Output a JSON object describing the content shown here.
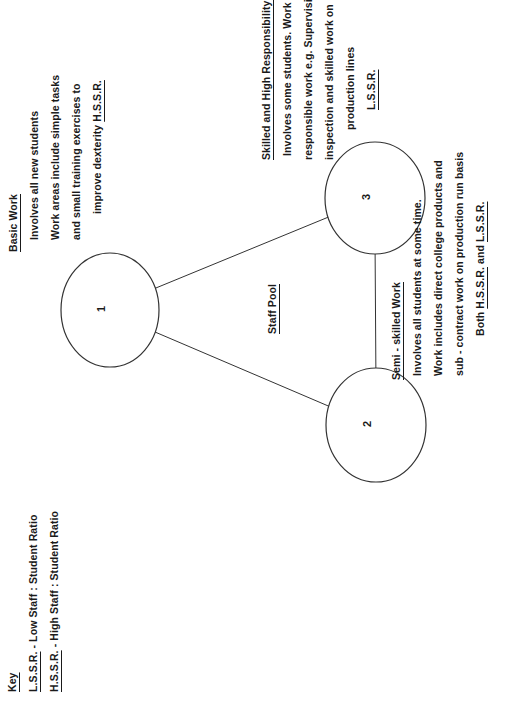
{
  "key": {
    "title": "Key",
    "items": [
      {
        "abbr": "L.S.S.R.",
        "text": " - Low Staff : Student Ratio"
      },
      {
        "abbr": "H.S.S.R.",
        "text": " - High Staff : Student Ratio"
      }
    ]
  },
  "nodes": [
    {
      "id": "1",
      "label": "1"
    },
    {
      "id": "2",
      "label": "2"
    },
    {
      "id": "3",
      "label": "3"
    }
  ],
  "center_label": "Staff Pool",
  "basic_work": {
    "title": "Basic Work",
    "lines": [
      "Involves all new students",
      "Work  areas include simple tasks",
      "and small training exercises to",
      "improve dexterity "
    ],
    "ratio": "H.S.S.R."
  },
  "skilled_work": {
    "title": "Skilled and High Responsibility Work",
    "lines": [
      "Involves some students. Work includes",
      "responsible work e.g. Supervision and",
      "inspection and skilled work on",
      "production lines"
    ],
    "ratio": "L.S.S.R."
  },
  "semi_skilled_work": {
    "title": "Semi - skilled Work",
    "lines": [
      "Involves all students at some time.",
      "Work includes direct college products and",
      "sub - contract work on production run basis"
    ],
    "ratio_prefix": "Both ",
    "ratio_a": "H.S.S.R.",
    "ratio_join": " and ",
    "ratio_b": "L.S.S.R."
  }
}
